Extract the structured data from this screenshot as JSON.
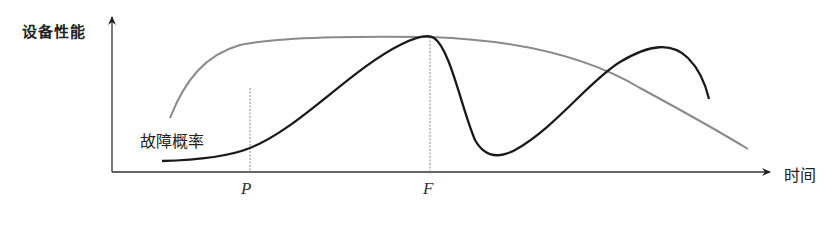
{
  "diagram": {
    "type": "concept-curve",
    "y_axis_label": "设备性能",
    "x_axis_label": "时间",
    "curve_labels": {
      "failure_probability": "故障概率"
    },
    "markers": [
      {
        "id": "P",
        "label": "P"
      },
      {
        "id": "F",
        "label": "F"
      }
    ],
    "curves": [
      {
        "name": "设备性能",
        "color": "#8a8a8a"
      },
      {
        "name": "故障概率",
        "color": "#1a1a1a"
      }
    ],
    "colors": {
      "axis": "#333333",
      "performance_curve": "#8a8a8a",
      "failure_curve": "#1a1a1a",
      "guide_line": "#888888"
    }
  }
}
